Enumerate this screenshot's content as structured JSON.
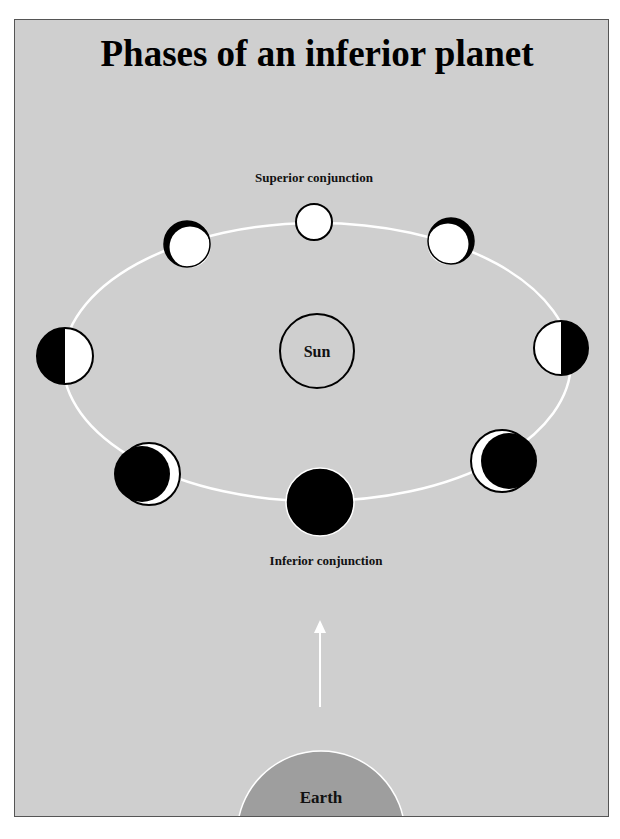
{
  "title": "Phases of an inferior planet",
  "labels": {
    "superior": "Superior conjunction",
    "inferior": "Inferior conjunction",
    "sun": "Sun",
    "earth": "Earth"
  },
  "colors": {
    "background": "#cfcfcf",
    "orbit": "#ffffff",
    "lit": "#ffffff",
    "dark": "#000000",
    "earth": "#9e9e9e"
  },
  "orbit": {
    "cx": 316,
    "cy": 361,
    "rx": 254,
    "ry": 139
  },
  "phases": [
    {
      "name": "full",
      "position": "superior-conjunction",
      "cx": 313,
      "cy": 221,
      "r": 18
    },
    {
      "name": "waning-gibbous",
      "position": "upper-left",
      "cx": 186,
      "cy": 244,
      "r": 23
    },
    {
      "name": "waxing-gibbous",
      "position": "upper-right",
      "cx": 450,
      "cy": 241,
      "r": 23
    },
    {
      "name": "last-quarter",
      "position": "left",
      "cx": 64,
      "cy": 355,
      "r": 28
    },
    {
      "name": "first-quarter",
      "position": "right",
      "cx": 560,
      "cy": 347,
      "r": 27
    },
    {
      "name": "waning-crescent",
      "position": "lower-left",
      "cx": 148,
      "cy": 473,
      "r": 31
    },
    {
      "name": "waxing-crescent",
      "position": "lower-right",
      "cx": 501,
      "cy": 460,
      "r": 31
    },
    {
      "name": "new",
      "position": "inferior-conjunction",
      "cx": 319,
      "cy": 501,
      "r": 34
    }
  ]
}
